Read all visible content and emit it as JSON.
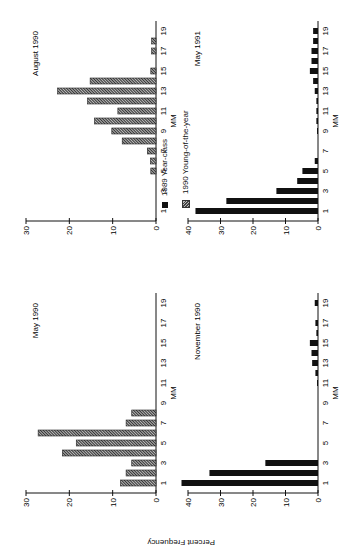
{
  "chart_data": [
    {
      "type": "bar",
      "title": "May 1990",
      "xlabel": "MM",
      "ylabel": "Percent Frequency",
      "ylim": [
        0,
        30
      ],
      "yticks": [
        0,
        10,
        20,
        30
      ],
      "xticks": [
        1,
        3,
        5,
        7,
        9,
        11,
        13,
        15,
        17,
        19
      ],
      "series": [
        {
          "name": "1990 Young-of-the-year",
          "x": [
            1,
            2,
            3,
            4,
            5,
            6,
            7,
            8
          ],
          "values": [
            8.2,
            6.9,
            5.6,
            21.6,
            18.4,
            27.2,
            6.9,
            5.6
          ]
        }
      ]
    },
    {
      "type": "bar",
      "title": "August 1990",
      "xlabel": "MM",
      "ylabel": "Percent Frequency",
      "ylim": [
        0,
        30
      ],
      "yticks": [
        0,
        10,
        20,
        30
      ],
      "xticks": [
        1,
        3,
        5,
        7,
        9,
        11,
        13,
        15,
        17,
        19
      ],
      "series": [
        {
          "name": "1990 Young-of-the-year",
          "x": [
            5,
            6,
            7,
            8,
            9,
            10,
            11,
            12,
            13,
            14,
            15,
            17,
            18
          ],
          "values": [
            1.2,
            1.3,
            2.0,
            7.8,
            10.2,
            14.2,
            8.8,
            15.8,
            22.7,
            15.2,
            1.2,
            1.0,
            1.0
          ]
        }
      ]
    },
    {
      "type": "bar",
      "title": "November 1990",
      "xlabel": "MM",
      "ylabel": "Percent Frequency",
      "ylim": [
        0,
        40
      ],
      "yticks": [
        0,
        10,
        20,
        30,
        40
      ],
      "xticks": [
        1,
        3,
        5,
        7,
        9,
        11,
        13,
        15,
        17,
        19
      ],
      "series": [
        {
          "name": "1989 Year-class",
          "x": [
            1,
            2,
            3,
            11,
            12,
            13,
            14,
            15,
            16,
            17,
            19
          ],
          "values": [
            42.0,
            33.4,
            16.2,
            0.3,
            0.8,
            1.8,
            2.0,
            2.5,
            0.5,
            0.8,
            1.0
          ]
        }
      ]
    },
    {
      "type": "bar",
      "title": "May 1991",
      "xlabel": "MM",
      "ylabel": "Percent Frequency",
      "ylim": [
        0,
        40
      ],
      "yticks": [
        0,
        10,
        20,
        30,
        40
      ],
      "xticks": [
        1,
        3,
        5,
        7,
        9,
        11,
        13,
        15,
        17,
        19
      ],
      "series": [
        {
          "name": "1989 Year-class",
          "x": [
            1,
            2,
            3,
            4,
            5,
            6,
            9,
            10,
            11,
            12,
            13,
            14,
            15,
            16,
            17,
            18,
            19
          ],
          "values": [
            37.7,
            28.2,
            12.8,
            6.4,
            4.8,
            1.0,
            0.3,
            0.5,
            0.5,
            0.5,
            1.0,
            1.5,
            2.5,
            2.0,
            2.0,
            1.5,
            1.5
          ]
        }
      ]
    }
  ],
  "legend": {
    "items": [
      {
        "label": "1989 Year-class",
        "swatch": "solid-black"
      },
      {
        "label": "1990 Young-of-the-year",
        "swatch": "hatched-gray"
      }
    ]
  },
  "axis": {
    "ylabel": "Percent Frequency",
    "xlabel": "MM"
  },
  "colors": {
    "solid": "#111111",
    "hatch": "#6a6a6a"
  }
}
